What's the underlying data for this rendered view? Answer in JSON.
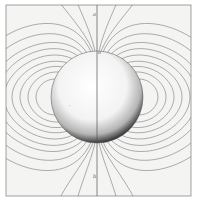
{
  "figure": {
    "labels": {
      "top_outer": "a",
      "top_pole": "a",
      "bottom_outer": "b",
      "sphere_mark": "."
    },
    "colors": {
      "background": "#f4f4f2",
      "lines": "#6a6a6a",
      "frame": "#8a8a8a",
      "sphere_shadow": "#3a3a3a"
    }
  }
}
